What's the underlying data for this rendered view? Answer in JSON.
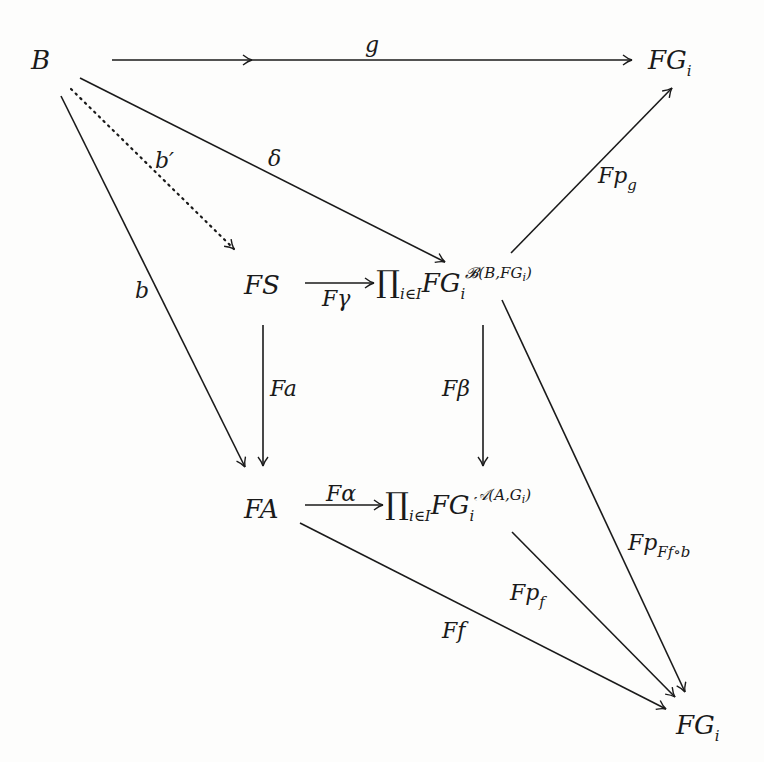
{
  "diagram": {
    "type": "commutative-diagram",
    "nodes": {
      "B": "B",
      "FG_top": {
        "base": "FG",
        "sub": "i"
      },
      "FS": "FS",
      "prod_top": {
        "prod": "∏",
        "index": "i∈I",
        "base": "FG",
        "sub": "i",
        "sup": "𝓑(B,FG",
        "sup_sub": "i",
        "sup_close": ")"
      },
      "FA": "FA",
      "prod_bottom": {
        "prod": "∏",
        "index": "i∈I",
        "base": "FG",
        "sub": "i",
        "sup": "𝒜(A,G",
        "sup_sub": "i",
        "sup_close": ")"
      },
      "FG_bottom": {
        "base": "FG",
        "sub": "i"
      }
    },
    "edges": [
      {
        "id": "g",
        "label": "g",
        "from": "B",
        "to": "FG_top",
        "style": "solid"
      },
      {
        "id": "delta",
        "label": "δ",
        "from": "B",
        "to": "prod_top",
        "style": "solid"
      },
      {
        "id": "b_prime",
        "label": "b′",
        "from": "B",
        "to": "FS",
        "style": "dotted"
      },
      {
        "id": "b",
        "label": "b",
        "from": "B",
        "to": "FA",
        "style": "solid"
      },
      {
        "id": "F_gamma",
        "label": "Fγ",
        "from": "FS",
        "to": "prod_top",
        "style": "solid"
      },
      {
        "id": "Fp_g",
        "label": {
          "base": "Fp",
          "sub": "g"
        },
        "from": "prod_top",
        "to": "FG_top",
        "style": "solid"
      },
      {
        "id": "Fa",
        "label": "Fa",
        "from": "FS",
        "to": "FA",
        "style": "solid"
      },
      {
        "id": "F_beta",
        "label": "Fβ",
        "from": "prod_top",
        "to": "prod_bottom",
        "style": "solid"
      },
      {
        "id": "F_alpha",
        "label": "Fα",
        "from": "FA",
        "to": "prod_bottom",
        "style": "solid"
      },
      {
        "id": "Fp_Ffob",
        "label": {
          "base": "Fp",
          "sub": "Ff∘b"
        },
        "from": "prod_top",
        "to": "FG_bottom",
        "style": "solid"
      },
      {
        "id": "Fp_f",
        "label": {
          "base": "Fp",
          "sub": "f"
        },
        "from": "prod_bottom",
        "to": "FG_bottom",
        "style": "solid"
      },
      {
        "id": "Ff",
        "label": "Ff",
        "from": "FA",
        "to": "FG_bottom",
        "style": "solid"
      }
    ]
  }
}
